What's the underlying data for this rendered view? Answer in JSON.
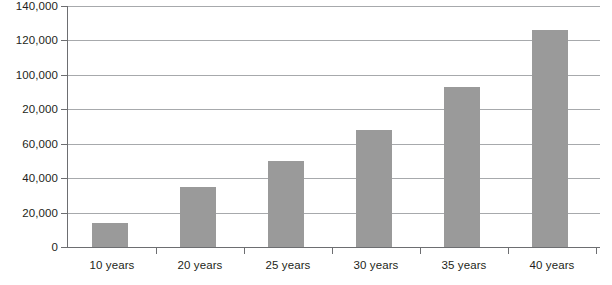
{
  "chart_data": {
    "type": "bar",
    "title": "",
    "xlabel": "",
    "ylabel": "",
    "categories": [
      "10 years",
      "20 years",
      "25 years",
      "30 years",
      "35 years",
      "40 years"
    ],
    "values": [
      14000,
      35000,
      50000,
      68000,
      93000,
      126000
    ],
    "series": [
      {
        "name": "",
        "values": [
          14000,
          35000,
          50000,
          68000,
          93000,
          126000
        ]
      }
    ],
    "ylim": [
      0,
      140000
    ],
    "ytick_values": [
      0,
      20000,
      40000,
      60000,
      80000,
      100000,
      120000,
      140000
    ],
    "ytick_labels": [
      "0",
      "20,000",
      "40,000",
      "60,000",
      "20,000",
      "100,000",
      "120,000",
      "140,000"
    ],
    "grid": true,
    "grid_axis": "y",
    "legend": false,
    "legend_position": "none",
    "bar_color": "#9a9a9a",
    "gridline_color": "#a7a9ac",
    "axis_color": "#6d6e71",
    "background_color": "#ffffff"
  },
  "axis": {
    "y_labels": [
      {
        "text": "140,000",
        "value": 140000
      },
      {
        "text": "120,000",
        "value": 120000
      },
      {
        "text": "100,000",
        "value": 100000
      },
      {
        "text": "20,000",
        "value": 80000
      },
      {
        "text": "60,000",
        "value": 60000
      },
      {
        "text": "40,000",
        "value": 40000
      },
      {
        "text": "20,000",
        "value": 20000
      },
      {
        "text": "0",
        "value": 0
      }
    ],
    "x_labels": [
      {
        "text": "10 years"
      },
      {
        "text": "20 years"
      },
      {
        "text": "25 years"
      },
      {
        "text": "30 years"
      },
      {
        "text": "35 years"
      },
      {
        "text": "40 years"
      }
    ]
  }
}
